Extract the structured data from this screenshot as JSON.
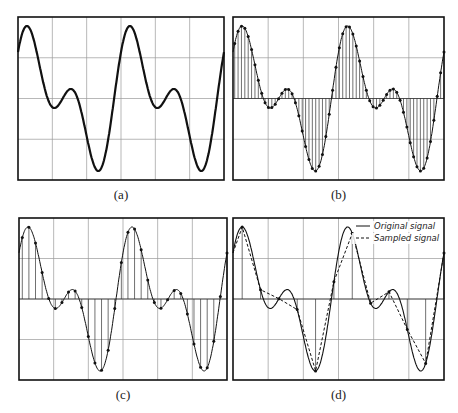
{
  "chart_data": [
    {
      "id": "a",
      "type": "line",
      "caption": "(a)",
      "title": "",
      "xlabel": "",
      "ylabel": "",
      "description": "Original continuous signal (two-tone sum)",
      "grid": true,
      "box": {
        "x": 18,
        "y": 17,
        "w": 206,
        "h": 163
      },
      "show_samples": false,
      "stems": false,
      "sampled_line": false,
      "curve_width": 2.2,
      "n_samples": 0
    },
    {
      "id": "b",
      "type": "line",
      "caption": "(b)",
      "title": "",
      "xlabel": "",
      "ylabel": "",
      "description": "Densely sampled signal with stems",
      "grid": true,
      "box": {
        "x": 233,
        "y": 17,
        "w": 211,
        "h": 163
      },
      "show_samples": true,
      "stems": true,
      "sampled_line": false,
      "curve_width": 1,
      "n_samples": 62
    },
    {
      "id": "c",
      "type": "line",
      "caption": "(c)",
      "title": "",
      "xlabel": "",
      "ylabel": "",
      "description": "Moderately sampled signal with stems",
      "grid": true,
      "box": {
        "x": 19,
        "y": 218,
        "w": 208,
        "h": 162
      },
      "show_samples": true,
      "stems": true,
      "sampled_line": false,
      "curve_width": 1,
      "n_samples": 31
    },
    {
      "id": "d",
      "type": "line",
      "caption": "(d)",
      "title": "",
      "xlabel": "",
      "ylabel": "",
      "description": "Undersampled signal: original vs linearly reconstructed sampled signal",
      "grid": true,
      "box": {
        "x": 233,
        "y": 218,
        "w": 211,
        "h": 162
      },
      "show_samples": true,
      "stems": true,
      "sampled_line": true,
      "curve_width": 1.1,
      "n_samples": 11,
      "legend": {
        "position": "upper right",
        "entries": [
          {
            "label": "Original signal",
            "style": "solid"
          },
          {
            "label": "Sampled signal",
            "style": "dashed"
          }
        ]
      }
    }
  ],
  "grid": {
    "cols": 6,
    "rows": 4,
    "color": "#9a9a9a"
  },
  "signal": {
    "periods": 2,
    "a1": 0.55,
    "a2": 0.45,
    "phase": 0.42,
    "yrange": [
      -1,
      1
    ]
  }
}
